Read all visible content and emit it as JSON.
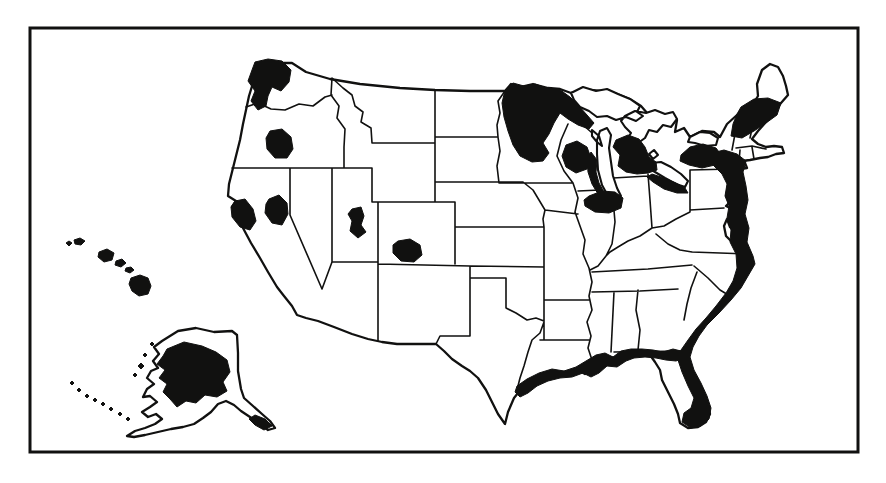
{
  "figure": {
    "style": "scanned monochrome line-art map, no text labels",
    "colors": {
      "paper": "#ffffff",
      "ink": "#111110"
    }
  },
  "map": {
    "shaded_region_names": [
      "puget-sound",
      "willamette-valley",
      "san-francisco-bay",
      "western-nevada",
      "salt-lake-area",
      "denver-area",
      "northeastern-minnesota",
      "southern-wisconsin",
      "lake-michigan-west-shore",
      "central-michigan-detroit",
      "lake-erie-south-shore",
      "central-illinois",
      "upstate-new-york",
      "northern-new-england",
      "atlantic-seaboard-to-florida",
      "gulf-coast",
      "hawaiian-islands",
      "alaska-interior",
      "alaska-panhandle",
      "aleutian-islands"
    ],
    "paths": {
      "mainland": "M 262,67 L 276,63 L 292,63 L 306,72 L 330,79 L 360,84 L 400,88 L 435,90 L 470,91 L 505,91 L 511,84 L 520,87 L 533,84 L 548,88 L 560,89 L 571,93 L 590,90 L 612,92 L 630,99 L 641,106 L 648,114 L 656,112 L 663,117 L 670,113 L 677,120 L 675,132 L 684,128 L 690,137 L 702,131 L 714,132 L 720,137 L 727,124 L 737,115 L 745,110 L 753,104 L 758,96 L 757,84 L 762,70 L 770,64 L 778,67 L 783,76 L 786,86 L 788,95 L 781,103 L 774,112 L 766,122 L 758,131 L 752,139 L 758,144 L 766,147 L 774,146 L 782,147 L 784,153 L 776,154 L 768,157 L 760,158 L 750,160 L 742,161 L 734,163 L 726,166 L 736,166 L 745,163 L 747,168 L 734,170 L 724,170 L 728,178 L 732,190 L 730,202 L 726,206 L 734,210 L 738,222 L 736,232 L 730,227 L 727,219 L 724,226 L 726,236 L 734,244 L 742,248 L 750,258 L 752,266 L 746,276 L 740,286 L 730,298 L 718,310 L 706,322 L 698,334 L 692,344 L 687,354 L 689,366 L 695,380 L 702,392 L 708,404 L 710,414 L 706,422 L 698,427 L 688,428 L 680,423 L 678,414 L 674,404 L 668,392 L 662,380 L 660,370 L 655,362 L 650,355 L 642,352 L 634,352 L 624,354 L 614,358 L 604,356 L 596,360 L 588,362 L 592,370 L 585,374 L 578,370 L 566,372 L 554,372 L 542,376 L 532,382 L 522,388 L 514,398 L 508,412 L 505,424 L 498,414 L 492,402 L 486,390 L 478,378 L 470,371 L 462,366 L 452,359 L 444,351 L 436,344 L 420,344 L 397,344 L 382,342 L 368,339 L 352,334 L 334,327 L 318,321 L 306,318 L 297,315 L 292,306 L 284,296 L 277,287 L 268,272 L 260,258 L 251,243 L 243,228 L 237,216 L 232,207 L 236,201 L 228,196 L 229,184 L 232,172 L 236,156 L 240,140 L 243,124 L 246,110 L 249,96 L 253,83 L 257,73 Z",
      "state_lines": "M 246,107 L 258,103 L 271,109 L 285,110 L 299,104 L 313,106 L 325,97 L 332,95 M 332,78 L 331,95 L 339,106 L 337,118 L 345,129 L 344,147 L 344,168 M 332,78 L 343,88 L 352,95 L 355,106 L 363,112 L 361,122 L 371,128 L 372,143 M 232,168 L 290,168 L 372,168 M 290,168 L 290,215 L 322,289 M 332,168 L 332,262 M 332,262 L 378,262 M 332,262 L 322,289 M 372,168 L 372,202 M 372,202 L 455,202 M 372,143 L 435,143 M 435,90 L 435,202 M 378,202 L 378,262 M 378,262 L 378,341 M 378,264 L 470,266 L 544,267 M 455,202 L 455,264 M 455,227 L 544,227 M 435,137 L 498,137 M 435,182 L 523,182 L 533,190 L 539,200 L 545,210 L 543,219 L 544,227 M 505,91 L 498,101 L 500,113 L 497,125 L 498,137 L 500,151 L 497,166 L 499,183 M 499,183 L 573,183 M 545,210 L 578,214 M 544,227 L 544,340 M 544,300 L 590,300 M 540,340 L 589,340 M 470,266 L 470,278 M 470,278 L 506,278 M 506,278 L 506,308 M 506,308 L 516,313 L 527,320 L 536,318 L 544,321 M 544,322 L 540,333 L 532,340 L 528,352 L 524,366 L 520,378 L 518,386 M 470,266 L 470,336 L 440,336 L 436,344 M 573,183 L 578,198 L 575,212 L 580,226 L 585,240 L 583,254 L 589,268 L 592,282 L 589,296 L 592,310 L 587,322 L 591,336 L 588,348 L 592,360 M 578,191 L 600,190 M 568,124 L 561,140 L 557,156 L 564,171 L 573,183 M 582,124 L 591,132 L 599,139 M 613,199 L 615,222 L 612,244 L 606,256 M 606,256 L 598,266 L 590,270 M 648,174 L 650,200 L 652,228 M 613,178 L 648,176 M 690,170 L 732,169 M 690,170 L 690,212 M 652,228 L 640,236 L 628,241 L 618,247 L 610,252 L 606,256 M 690,212 L 676,219 L 664,226 L 652,228 M 690,210 L 724,208 M 656,234 L 668,244 L 680,250 L 692,252 M 692,252 L 748,254 M 592,272 L 648,269 L 692,265 M 592,292 L 640,291 L 678,289 M 694,266 L 708,278 L 720,290 L 730,296 M 697,272 L 691,288 L 687,304 L 684,320 M 638,290 L 636,310 L 640,330 L 638,350 M 614,292 L 611,352 M 614,352 L 683,351 M 737,116 L 735,134 L 732,150 M 736,148 L 752,146 L 766,149 M 740,150 L 739,162 M 752,147 L 754,159 M 751,107 L 753,124 L 750,138 M 724,172 L 728,184 L 726,196 L 730,206",
      "lakes": "M 571,93 L 583,87 L 596,91 L 607,89 L 618,94 L 630,99 L 640,106 L 637,112 L 643,116 L 636,121 L 626,117 L 616,120 L 607,116 L 597,117 L 589,111 L 580,107 L 574,100 Z M 600,131 L 607,128 L 611,135 L 609,148 L 611,162 L 613,176 L 617,188 L 621,196 L 616,200 L 608,196 L 602,185 L 598,170 L 597,154 L 597,140 Z M 592,130 L 599,136 L 602,146 L 597,142 L 592,136 Z M 625,116 L 635,111 L 646,113 L 655,110 L 665,114 L 673,112 L 677,119 L 671,127 L 663,125 L 657,132 L 649,130 L 645,138 L 638,143 L 631,147 L 626,141 L 631,133 L 625,127 L 621,121 Z M 649,154 L 654,150 L 658,155 L 653,159 Z M 651,163 L 661,162 L 671,167 L 681,174 L 688,181 L 685,187 L 676,184 L 665,178 L 655,172 L 648,168 Z M 690,137 L 700,132 L 710,133 L 718,138 L 716,145 L 705,146 L 695,143 L 688,142 Z",
      "alaska": "M 178,331 L 196,328 L 214,332 L 232,331 L 237,335 L 238,353 L 238,371 L 241,389 L 244,398 L 253,406 L 262,414 L 270,421 L 275,428 L 268,430 L 259,423 L 250,417 L 241,411 L 234,405 L 226,401 L 218,404 L 211,412 L 203,418 L 194,424 L 183,427 L 171,429 L 158,432 L 145,435 L 134,437 L 127,436 L 135,431 L 145,428 L 155,424 L 162,419 L 156,414 L 148,417 L 142,412 L 150,407 L 157,402 L 150,396 L 143,397 L 147,389 L 154,384 L 147,378 L 151,371 L 158,368 L 153,361 L 159,354 L 154,347 L 162,341 L 170,336 Z",
      "shaded": "M 255,62 L 268,59 L 282,61 L 291,70 L 289,82 L 281,91 L 272,87 L 268,96 L 266,106 L 258,110 L 251,101 L 255,91 L 248,81 L 252,70 Z M 270,131 L 282,129 L 291,137 L 293,149 L 287,158 L 275,158 L 267,149 L 266,138 Z M 235,201 L 245,199 L 253,209 L 256,221 L 250,230 L 240,227 L 232,217 L 231,207 Z M 269,199 L 279,195 L 287,203 L 288,214 L 282,225 L 272,223 L 265,213 L 266,204 Z M 352,209 L 361,207 L 364,216 L 361,225 L 366,232 L 358,238 L 350,231 L 352,221 L 348,214 Z M 398,241 L 410,239 L 420,245 L 422,255 L 414,262 L 401,261 L 393,253 L 393,245 Z M 505,90 L 513,83 L 524,86 L 535,84 L 547,88 L 559,89 L 570,97 L 579,106 L 587,115 L 594,123 L 589,129 L 578,125 L 568,119 L 560,113 L 554,123 L 549,134 L 543,143 L 549,153 L 543,161 L 532,162 L 520,156 L 513,145 L 508,131 L 504,117 L 502,103 Z M 566,145 L 577,141 L 587,147 L 591,158 L 587,169 L 576,173 L 566,167 L 562,156 Z M 591,152 L 597,160 L 596,172 L 599,183 L 604,192 L 598,194 L 592,184 L 588,172 L 587,160 Z M 616,140 L 628,135 L 639,139 L 645,147 L 649,157 L 656,162 L 657,170 L 648,173 L 637,174 L 626,172 L 618,166 L 620,155 L 613,147 Z M 652,174 L 664,178 L 676,183 L 685,188 L 688,193 L 677,193 L 664,189 L 653,182 L 647,177 Z M 589,196 L 602,191 L 615,192 L 623,198 L 621,208 L 609,213 L 595,212 L 585,206 L 584,200 Z M 681,155 L 690,147 L 703,144 L 716,148 L 722,156 L 715,165 L 702,168 L 689,165 L 680,161 Z M 741,107 L 754,99 L 768,98 L 781,103 L 777,115 L 766,123 L 754,131 L 742,138 L 731,136 L 733,124 L 737,114 Z M 712,153 L 724,150 L 737,154 L 746,161 L 743,172 L 746,186 L 748,200 L 745,214 L 749,228 L 747,242 L 753,256 L 755,264 L 748,276 L 741,288 L 731,300 L 719,313 L 707,325 L 699,336 L 693,347 L 690,357 L 694,370 L 701,383 L 707,396 L 711,408 L 709,419 L 701,426 L 691,428 L 682,422 L 684,413 L 691,408 L 694,398 L 688,386 L 682,372 L 678,360 L 681,350 L 688,340 L 696,329 L 706,318 L 716,306 L 726,293 L 733,281 L 737,268 L 736,254 L 730,242 L 731,230 L 727,218 L 729,206 L 725,196 L 727,184 L 722,174 L 714,166 L 709,159 Z M 517,386 L 527,379 L 539,373 L 552,369 L 564,371 L 576,367 L 586,361 L 596,355 L 605,353 L 613,357 L 621,351 L 631,349 L 642,349 L 653,350 L 663,352 L 673,349 L 681,351 L 684,358 L 676,361 L 666,360 L 656,358 L 645,357 L 634,358 L 626,361 L 617,367 L 607,366 L 599,373 L 591,377 L 583,373 L 572,377 L 560,378 L 548,381 L 537,386 L 528,393 L 520,397 L 515,392 Z M 66,243 L 69,241 L 72,243 L 69,246 Z M 74,240 L 80,238 L 85,241 L 81,245 L 75,244 Z M 99,252 L 107,249 L 114,253 L 112,260 L 104,262 L 98,257 Z M 116,261 L 122,259 L 126,263 L 121,267 L 115,265 Z M 126,268 L 131,267 L 134,270 L 130,273 L 125,271 Z M 131,278 L 140,275 L 148,278 L 151,286 L 148,294 L 139,296 L 132,291 L 129,284 Z M 167,349 L 184,342 L 202,346 L 216,352 L 227,360 L 230,372 L 223,382 L 227,391 L 217,397 L 205,395 L 196,403 L 186,401 L 177,407 L 170,399 L 163,392 L 167,384 L 159,378 L 165,370 L 157,364 L 163,356 Z M 255,415 L 265,419 L 272,426 L 264,430 L 255,425 L 249,419 Z M 70,383 l 2,-2 l 2,2 l -2,2 Z M 77,390 l 2,-2 l 2,2 l -2,2 Z M 85,396 l 2,-2 l 2,2 l -2,2 Z M 93,400 l 2,-2 l 2,2 l -2,2 Z M 101,404 l 2,-2 l 2,2 l -2,2 Z M 109,409 l 2,-2 l 2,2 l -2,2 Z M 118,414 l 2,-2 l 2,2 l -2,2 Z M 126,419 l 2,-2 l 2,2 l -2,2 Z M 150,344 l 2,-2 l 2,2 l -2,2 Z M 143,355 l 2,-2 l 2,2 l -2,2 Z M 138,366 l 3,-3 l 3,3 l -3,3 Z M 133,375 l 2,-2 l 2,2 l -2,2 Z"
    }
  }
}
